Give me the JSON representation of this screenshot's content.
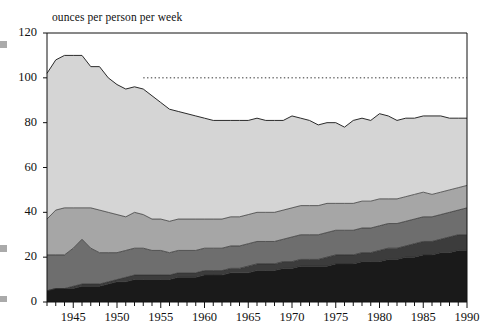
{
  "chart_data": {
    "type": "area",
    "stacked": true,
    "title": "ounces per person per week",
    "xlabel": "",
    "ylabel": "ounces per person per week",
    "xlim": [
      1942,
      1990
    ],
    "ylim": [
      0,
      120
    ],
    "ytick_values": [
      0,
      20,
      40,
      60,
      80,
      100,
      120
    ],
    "xtick_values": [
      1945,
      1950,
      1955,
      1960,
      1965,
      1970,
      1975,
      1980,
      1985,
      1990
    ],
    "minor_xticks": "every year",
    "grid": false,
    "legend": "none",
    "annotations": [
      {
        "type": "reference-line",
        "style": "dotted",
        "y": 100,
        "x_start": 1953,
        "x_end": 1990,
        "color": "#333333"
      }
    ],
    "x": [
      1942,
      1943,
      1944,
      1945,
      1946,
      1947,
      1948,
      1949,
      1950,
      1951,
      1952,
      1953,
      1954,
      1955,
      1956,
      1957,
      1958,
      1959,
      1960,
      1961,
      1962,
      1963,
      1964,
      1965,
      1966,
      1967,
      1968,
      1969,
      1970,
      1971,
      1972,
      1973,
      1974,
      1975,
      1976,
      1977,
      1978,
      1979,
      1980,
      1981,
      1982,
      1983,
      1984,
      1985,
      1986,
      1987,
      1988,
      1989,
      1990
    ],
    "series": [
      {
        "name": "band-1",
        "color": "#1a1a1a",
        "values": [
          5,
          6,
          6,
          6,
          7,
          7,
          7,
          8,
          9,
          9,
          10,
          10,
          10,
          10,
          10,
          11,
          11,
          11,
          12,
          12,
          12,
          13,
          13,
          13,
          14,
          14,
          14,
          15,
          15,
          16,
          16,
          16,
          16,
          17,
          17,
          17,
          18,
          18,
          18,
          19,
          19,
          20,
          20,
          21,
          21,
          22,
          22,
          23,
          23
        ]
      },
      {
        "name": "band-2",
        "color": "#3c3c3c",
        "values": [
          0,
          0,
          0,
          1,
          1,
          1,
          1,
          1,
          1,
          2,
          2,
          2,
          2,
          2,
          2,
          2,
          2,
          2,
          2,
          2,
          2,
          2,
          2,
          3,
          3,
          3,
          3,
          3,
          3,
          3,
          3,
          3,
          4,
          4,
          4,
          4,
          4,
          4,
          5,
          5,
          5,
          5,
          6,
          6,
          6,
          6,
          7,
          7,
          7
        ]
      },
      {
        "name": "band-3",
        "color": "#6e6e6e",
        "values": [
          16,
          15,
          15,
          17,
          20,
          16,
          14,
          13,
          12,
          12,
          12,
          12,
          11,
          11,
          10,
          10,
          10,
          10,
          10,
          10,
          10,
          10,
          10,
          10,
          10,
          10,
          10,
          10,
          11,
          11,
          11,
          11,
          11,
          11,
          11,
          11,
          11,
          11,
          11,
          11,
          11,
          11,
          11,
          11,
          11,
          11,
          11,
          11,
          12
        ]
      },
      {
        "name": "band-4",
        "color": "#a6a6a6",
        "values": [
          16,
          20,
          21,
          18,
          14,
          18,
          19,
          18,
          17,
          15,
          16,
          15,
          14,
          14,
          14,
          14,
          14,
          14,
          13,
          13,
          13,
          13,
          13,
          13,
          13,
          13,
          13,
          13,
          13,
          13,
          13,
          13,
          13,
          12,
          12,
          12,
          12,
          12,
          12,
          11,
          11,
          11,
          11,
          11,
          10,
          10,
          10,
          10,
          10
        ]
      },
      {
        "name": "band-5",
        "color": "#d5d5d5",
        "values": [
          65,
          67,
          68,
          68,
          68,
          63,
          64,
          60,
          58,
          57,
          56,
          56,
          55,
          52,
          50,
          48,
          47,
          46,
          45,
          44,
          44,
          43,
          43,
          42,
          42,
          41,
          41,
          40,
          41,
          39,
          38,
          36,
          36,
          36,
          34,
          37,
          37,
          36,
          38,
          37,
          35,
          35,
          34,
          34,
          35,
          34,
          32,
          31,
          30
        ]
      }
    ],
    "series_totals_top": [
      102,
      108,
      110,
      110,
      110,
      105,
      105,
      100,
      97,
      95,
      96,
      95,
      92,
      89,
      86,
      85,
      84,
      83,
      82,
      81,
      81,
      81,
      81,
      81,
      82,
      81,
      81,
      81,
      83,
      82,
      81,
      79,
      80,
      80,
      78,
      81,
      82,
      81,
      84,
      83,
      81,
      82,
      82,
      83,
      83,
      83,
      82,
      82,
      82
    ]
  },
  "scan": {
    "left_marks": 3
  }
}
